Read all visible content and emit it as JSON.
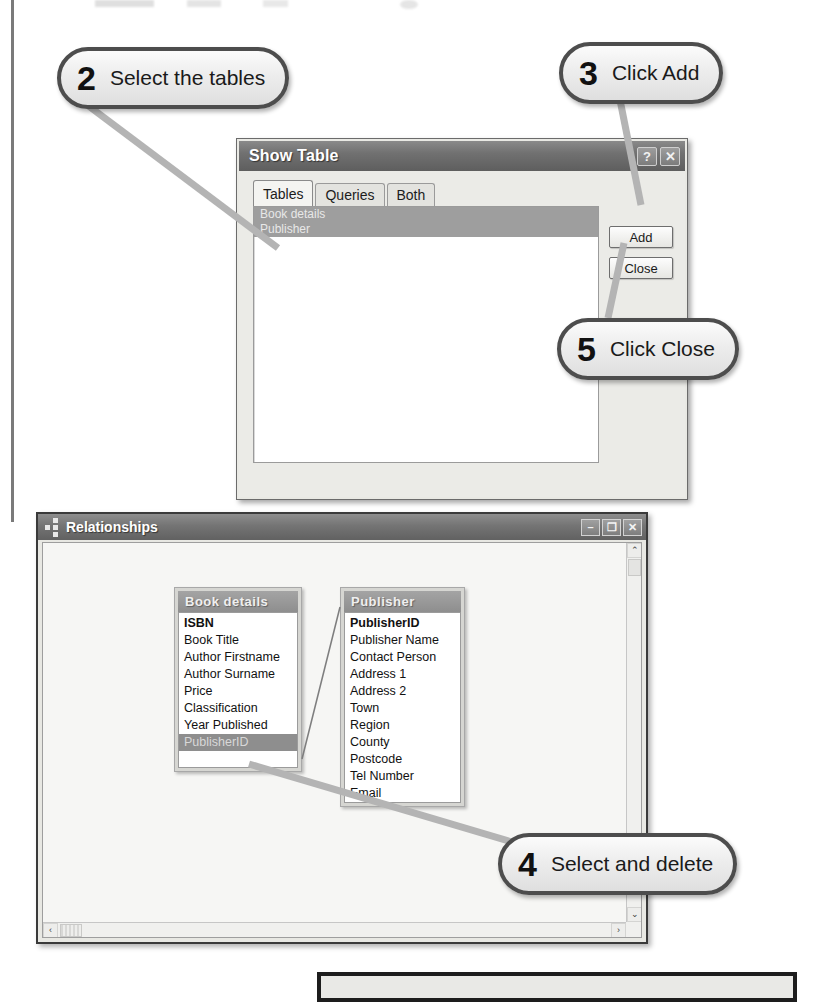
{
  "callouts": [
    {
      "number": "2",
      "text": "Select the tables"
    },
    {
      "number": "3",
      "text": "Click Add"
    },
    {
      "number": "5",
      "text": "Click Close"
    },
    {
      "number": "4",
      "text": "Select and delete"
    }
  ],
  "show_table_dialog": {
    "title": "Show Table",
    "help_icon": "?",
    "close_icon": "✕",
    "tabs": [
      {
        "label": "Tables",
        "active": true
      },
      {
        "label": "Queries",
        "active": false
      },
      {
        "label": "Both",
        "active": false
      }
    ],
    "list_items": [
      {
        "label": "Book details",
        "selected": true
      },
      {
        "label": "Publisher",
        "selected": true
      }
    ],
    "buttons": {
      "add": "Add",
      "close": "Close"
    }
  },
  "relationships_window": {
    "title": "Relationships",
    "window_buttons": {
      "minimize": "–",
      "maximize": "❐",
      "close": "✕"
    },
    "scrollbars": {
      "vertical_up": "⌃",
      "vertical_down": "⌄",
      "horizontal_left": "‹",
      "horizontal_right": "›"
    },
    "field_lists": [
      {
        "title": "Book details",
        "fields": [
          {
            "name": "ISBN",
            "primary_key": true,
            "selected": false
          },
          {
            "name": "Book Title",
            "primary_key": false,
            "selected": false
          },
          {
            "name": "Author Firstname",
            "primary_key": false,
            "selected": false
          },
          {
            "name": "Author Surname",
            "primary_key": false,
            "selected": false
          },
          {
            "name": "Price",
            "primary_key": false,
            "selected": false
          },
          {
            "name": "Classification",
            "primary_key": false,
            "selected": false
          },
          {
            "name": "Year Published",
            "primary_key": false,
            "selected": false
          },
          {
            "name": "PublisherID",
            "primary_key": false,
            "selected": true
          }
        ]
      },
      {
        "title": "Publisher",
        "fields": [
          {
            "name": "PublisherID",
            "primary_key": true,
            "selected": false
          },
          {
            "name": "Publisher Name",
            "primary_key": false,
            "selected": false
          },
          {
            "name": "Contact Person",
            "primary_key": false,
            "selected": false
          },
          {
            "name": "Address 1",
            "primary_key": false,
            "selected": false
          },
          {
            "name": "Address 2",
            "primary_key": false,
            "selected": false
          },
          {
            "name": "Town",
            "primary_key": false,
            "selected": false
          },
          {
            "name": "Region",
            "primary_key": false,
            "selected": false
          },
          {
            "name": "County",
            "primary_key": false,
            "selected": false
          },
          {
            "name": "Postcode",
            "primary_key": false,
            "selected": false
          },
          {
            "name": "Tel Number",
            "primary_key": false,
            "selected": false
          },
          {
            "name": "Email",
            "primary_key": false,
            "selected": false
          }
        ]
      }
    ]
  },
  "colors": {
    "selection": "#9e9e9e",
    "titlebar": "#717171",
    "callout_border": "#4d4d4d",
    "leader_line": "#b4b4b4",
    "window_border": "#3a3a3a"
  }
}
